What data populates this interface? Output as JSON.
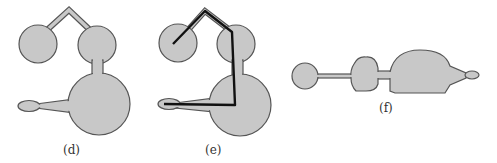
{
  "figure": {
    "panels": [
      {
        "id": "d",
        "label": "(d)",
        "description": "Blob shape: two circles joined by a bent narrow bridge, one linked to a large circle with a tapered arm ending in a small ellipse"
      },
      {
        "id": "e",
        "label": "(e)",
        "description": "Same shape as (d) with its medial-axis skeleton path drawn in black"
      },
      {
        "id": "f",
        "label": "(f)",
        "description": "Shape straightened into a horizontal chain of blobs"
      }
    ],
    "colors": {
      "fill": "#c8c8c8",
      "stroke": "#555555",
      "skeleton": "#111111",
      "background": "#ffffff"
    }
  }
}
